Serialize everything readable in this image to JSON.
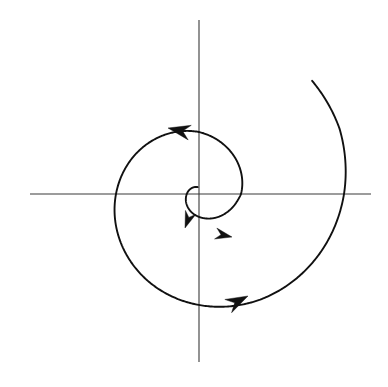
{
  "figure": {
    "background_color": "#ffffff",
    "width": 388,
    "height": 387,
    "curve_color": "#111111",
    "axis_color": "#3a3a3a",
    "arrow_color": "#111111"
  },
  "chart_data": {
    "type": "line",
    "title": "",
    "subtitle": "",
    "xlabel": "",
    "ylabel": "",
    "grid": false,
    "legend": null,
    "annotations": [],
    "axes": {
      "origin_px": [
        199,
        194
      ],
      "x_axis_px": {
        "x_start": 30,
        "x_end": 371,
        "y": 194
      },
      "y_axis_px": {
        "y_start": 20,
        "y_end": 362,
        "x": 199
      },
      "xlim": [
        -169,
        172
      ],
      "ylim": [
        -168,
        174
      ],
      "tick_labels_x": [],
      "tick_labels_y": []
    },
    "series": [
      {
        "name": "outward spiral trajectory",
        "description": "Counterclockwise logarithmic spiral starting near the origin and growing outward",
        "direction": "counterclockwise",
        "equation": "r = a * exp(b * theta)",
        "r_start_px": 7,
        "r_end_px": 160,
        "theta_start_deg": 100,
        "theta_turns": 2.35,
        "polar_points_px": [
          {
            "theta_deg": 100,
            "r": 7
          },
          {
            "theta_deg": 150,
            "r": 10
          },
          {
            "theta_deg": 200,
            "r": 14
          },
          {
            "theta_deg": 250,
            "r": 20
          },
          {
            "theta_deg": 300,
            "r": 28
          },
          {
            "theta_deg": 350,
            "r": 39
          },
          {
            "theta_deg": 360,
            "r": 42
          },
          {
            "theta_deg": 400,
            "r": 50
          },
          {
            "theta_deg": 450,
            "r": 62
          },
          {
            "theta_deg": 500,
            "r": 73
          },
          {
            "theta_deg": 540,
            "r": 83
          },
          {
            "theta_deg": 600,
            "r": 101
          },
          {
            "theta_deg": 630,
            "r": 111
          },
          {
            "theta_deg": 660,
            "r": 122
          },
          {
            "theta_deg": 700,
            "r": 137
          },
          {
            "theta_deg": 720,
            "r": 145
          },
          {
            "theta_deg": 745,
            "r": 155
          },
          {
            "theta_deg": 765,
            "r": 160
          }
        ],
        "axis_crossings_px": [
          {
            "label": "inner-right",
            "x": 257,
            "y": 194
          },
          {
            "label": "inner-top",
            "x": 199,
            "y": 126
          },
          {
            "label": "outer-left",
            "x": 116,
            "y": 194
          },
          {
            "label": "outer-bottom",
            "x": 199,
            "y": 300
          },
          {
            "label": "outer-right",
            "x": 330,
            "y": 194
          },
          {
            "label": "terminus-top",
            "x": 190,
            "y": 44
          }
        ]
      }
    ],
    "arrows": [
      {
        "name": "inner-arrow-down-left",
        "x": 185,
        "y": 228,
        "angle_deg": 250,
        "size": 9
      },
      {
        "name": "inner-arrow-right",
        "x": 232,
        "y": 237,
        "angle_deg": 348,
        "size": 9
      },
      {
        "name": "mid-arrow-left",
        "x": 168,
        "y": 128,
        "angle_deg": 168,
        "size": 12
      },
      {
        "name": "outer-arrow-right-down",
        "x": 248,
        "y": 296,
        "angle_deg": 27,
        "size": 12
      }
    ]
  }
}
